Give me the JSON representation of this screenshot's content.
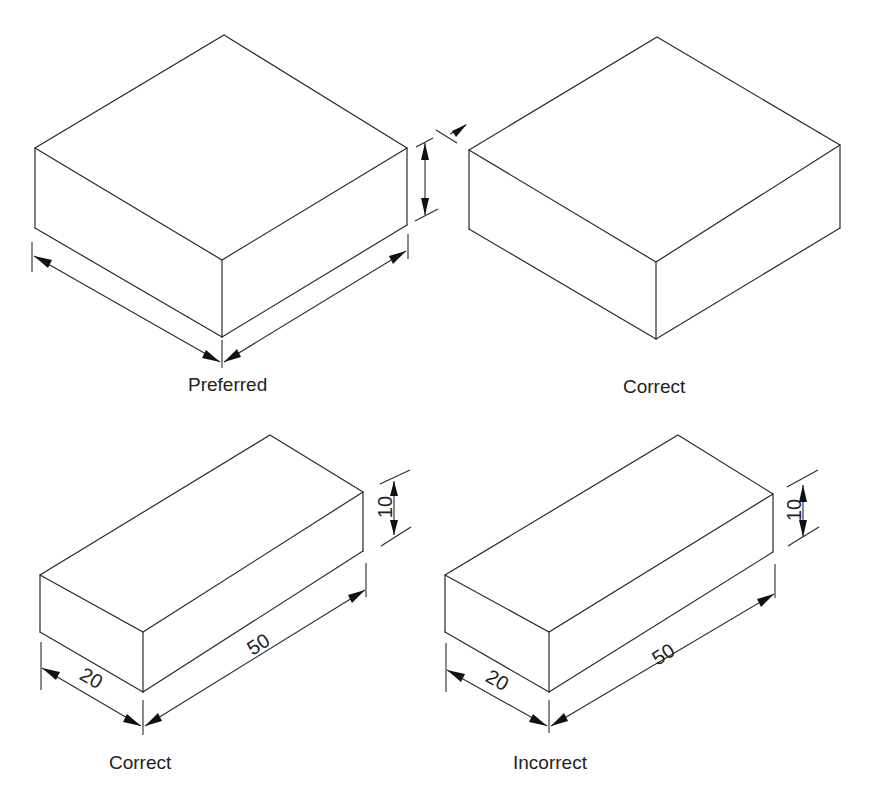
{
  "figure": {
    "panels": [
      {
        "id": "top-left",
        "caption": "Preferred",
        "shape": "isometric rectangular block",
        "dimension_style": "dimension lines with arrowheads, no values; height dimension outside right edge"
      },
      {
        "id": "top-right",
        "caption": "Correct",
        "shape": "isometric rectangular block",
        "dimension_style": "no dimensions on block; leader pointing at extension line"
      },
      {
        "id": "bottom-left",
        "caption": "Correct",
        "shape": "isometric rectangular block",
        "dimensions": {
          "width": "20",
          "length": "50",
          "height": "10"
        },
        "dimension_style": "aligned text along dimension lines"
      },
      {
        "id": "bottom-right",
        "caption": "Incorrect",
        "shape": "isometric rectangular block",
        "dimensions": {
          "width": "20",
          "length": "50",
          "height": "10"
        },
        "dimension_style": "length value '50' placed across the dimension line"
      }
    ]
  },
  "labels": {
    "preferred": "Preferred",
    "correct_top": "Correct",
    "correct_bottom": "Correct",
    "incorrect": "Incorrect"
  },
  "dims": {
    "bl_width": "20",
    "bl_length": "50",
    "bl_height": "10",
    "br_width": "20",
    "br_length": "50",
    "br_height": "10"
  },
  "colors": {
    "line": "#2a2a2a",
    "background": "#ffffff"
  }
}
